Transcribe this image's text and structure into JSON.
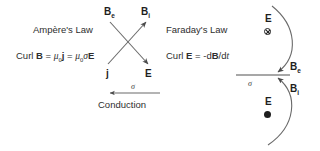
{
  "figure": {
    "background_color": "#ffffff",
    "stroke_color": "#5a5a5a",
    "text_color": "#2e2e2e"
  },
  "ampere": {
    "title": "Ampère's Law",
    "equation": {
      "curl_word": "Curl",
      "curl_field": "B",
      "equals_1": "=",
      "mu_symbol": "μ",
      "mu_subscript": "0",
      "current_field": "j",
      "equals_2": "=",
      "mu_symbol_2": "μ",
      "mu_subscript_2": "0",
      "sigma_symbol": "σ",
      "e_field": "E",
      "plain_text": "Curl B = μ0 j = μ0σE"
    }
  },
  "faraday": {
    "title": "Faraday's Law",
    "equation": {
      "curl_word": "Curl",
      "curl_field": "E",
      "equals": "=",
      "rhs": "-d",
      "b_field": "B",
      "slash": "/d",
      "t_var": "t",
      "plain_text": "Curl E = -dB/dt"
    }
  },
  "cross_arrows": {
    "top_left_label": {
      "symbol": "B",
      "subscript": "e"
    },
    "top_right_label": {
      "symbol": "B",
      "subscript": "i"
    },
    "bottom_left_label": {
      "symbol": "j",
      "subscript": ""
    },
    "bottom_right_label": {
      "symbol": "E",
      "subscript": ""
    }
  },
  "conduction": {
    "sigma": "σ",
    "caption": "Conduction",
    "arrow_direction": "left"
  },
  "right_panel": {
    "conductor_sigma": "σ",
    "top": {
      "field_label": "E",
      "field_marker": "into-page",
      "arc_label": {
        "symbol": "B",
        "subscript": "e"
      }
    },
    "bottom": {
      "field_label": "E",
      "field_marker": "out-of-page",
      "arc_label": {
        "symbol": "B",
        "subscript": "i"
      }
    }
  }
}
